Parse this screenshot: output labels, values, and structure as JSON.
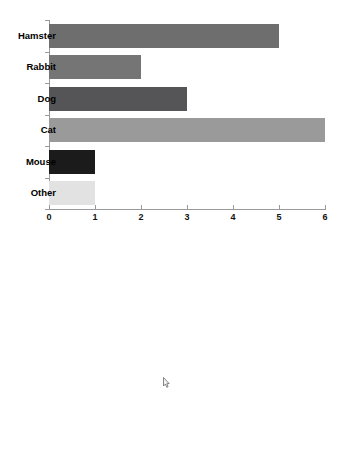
{
  "chart_data": [
    {
      "type": "bar",
      "orientation": "horizontal",
      "title": "",
      "xlabel": "",
      "ylabel": "",
      "categories": [
        "Hamster",
        "Rabbit",
        "Dog",
        "Cat",
        "Mouse",
        "Other"
      ],
      "values": [
        5,
        2,
        3,
        6,
        1,
        1
      ],
      "xlim": [
        0,
        6
      ],
      "xticks": [
        0,
        1,
        2,
        3,
        4,
        5,
        6
      ],
      "xtick_labels": [
        "0",
        "1",
        "2",
        "3",
        "4",
        "5",
        "6"
      ],
      "grid": false,
      "legend": "none",
      "bar_colors": [
        "#6e6e6e",
        "#757575",
        "#555557",
        "#9a9a9a",
        "#1b1b1b",
        "#e2e2e2"
      ]
    },
    {
      "type": "bar",
      "orientation": "vertical",
      "title": "",
      "xlabel": "",
      "ylabel": "",
      "categories": [
        "Hamster",
        "Rabbit",
        "Dog",
        "Cat",
        "Mouse",
        "Other"
      ],
      "values": [
        5,
        2,
        3,
        6,
        1,
        1
      ],
      "ylim": [
        0,
        6
      ],
      "yticks": [
        0,
        1,
        2,
        3,
        4,
        5,
        6
      ],
      "ytick_labels": [
        "0",
        "1",
        "2",
        "3",
        "4",
        "5",
        "6"
      ],
      "grid": false,
      "legend": "none",
      "bar_colors": [
        "#6e6e6e",
        "#757575",
        "#555557",
        "#9a9a9a",
        "#1b1b1b",
        "#e2e2e2"
      ]
    }
  ],
  "chart_horizontal": {
    "name": "horizontal-bar-chart",
    "category_labels": [
      "Hamster",
      "Rabbit",
      "Dog",
      "Cat",
      "Mouse",
      "Other"
    ],
    "xtick_labels": [
      "0",
      "1",
      "2",
      "3",
      "4",
      "5",
      "6"
    ]
  },
  "chart_vertical": {
    "name": "vertical-bar-chart",
    "ytick_labels": [
      "0",
      "1",
      "2",
      "3",
      "4",
      "5",
      "6"
    ],
    "category_labels": [
      "Hamster",
      "Rabbit",
      "Dog",
      "Cat",
      "Mouse",
      "Other"
    ]
  },
  "cursor": {
    "icon": "mouse-pointer-icon",
    "x": 163,
    "y": 377
  }
}
